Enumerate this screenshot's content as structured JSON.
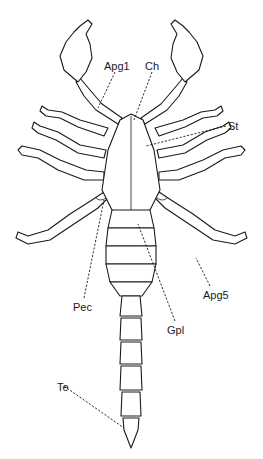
{
  "figure": {
    "background": "#ffffff",
    "ink": "#1a1a1a",
    "labels": [
      {
        "id": "apg1",
        "text": "Apg1",
        "x": 104,
        "y": 61
      },
      {
        "id": "ch",
        "text": "Ch",
        "x": 145,
        "y": 61
      },
      {
        "id": "st",
        "text": "St",
        "x": 228,
        "y": 121
      },
      {
        "id": "pec",
        "text": "Pec",
        "x": 73,
        "y": 302
      },
      {
        "id": "gpl",
        "text": "Gpl",
        "x": 167,
        "y": 325
      },
      {
        "id": "apg5",
        "text": "Apg5",
        "x": 203,
        "y": 290
      },
      {
        "id": "te",
        "text": "Te",
        "x": 57,
        "y": 382
      }
    ]
  }
}
